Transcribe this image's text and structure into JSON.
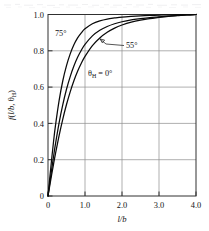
{
  "figure": {
    "background_color": "#ffffff",
    "ink_color": "#0a0a0a",
    "grid_color": "#8e8e8e",
    "scan_artifact_top": true
  },
  "chart_data": {
    "type": "line",
    "title": "",
    "subtitle": "",
    "xlabel": "l/b",
    "ylabel": "f(l/b, θH)",
    "ylabel_parts": {
      "f": "f",
      "open": "(",
      "x": "l/b",
      "comma": ", ",
      "theta": "θ",
      "sub": "H",
      "close": ")"
    },
    "xlim": [
      0,
      4.0
    ],
    "ylim": [
      0,
      1.0
    ],
    "xticks": [
      0,
      1.0,
      2.0,
      3.0,
      4.0
    ],
    "xtick_labels": [
      "0",
      "1.0",
      "2.0",
      "3.0",
      "4.0"
    ],
    "yticks": [
      0,
      0.2,
      0.4,
      0.6,
      0.8,
      1.0
    ],
    "ytick_labels": [
      "0",
      "0.2",
      "0.4",
      "0.6",
      "0.8",
      "1.0"
    ],
    "grid": true,
    "grid_axes": "both",
    "legend": "inline-annotations",
    "legend_position": "inside-plot",
    "annotations": [
      {
        "id": "ann-75",
        "text": "75°",
        "x_px": 55,
        "y_px": 33,
        "leader": false
      },
      {
        "id": "ann-55",
        "text": "55°",
        "x_px": 126,
        "y_px": 45,
        "leader": true
      },
      {
        "id": "ann-theta-0",
        "text": "θH = 0°",
        "x_px": 88,
        "y_px": 73,
        "leader": false
      }
    ],
    "annotation_theta_parts": {
      "theta": "θ",
      "sub": "H",
      "eq": " = 0",
      "deg": "°"
    },
    "series": [
      {
        "name": "75°",
        "label": "75°",
        "x": [
          0,
          0.05,
          0.1,
          0.15,
          0.2,
          0.3,
          0.4,
          0.5,
          0.6,
          0.7,
          0.8,
          0.9,
          1.0,
          1.2,
          1.4,
          1.6,
          1.8,
          2.0,
          2.25,
          2.5,
          2.75,
          3.0,
          3.25,
          3.5,
          3.75,
          4.0
        ],
        "values": [
          0,
          0.105,
          0.205,
          0.3,
          0.385,
          0.525,
          0.635,
          0.718,
          0.783,
          0.833,
          0.871,
          0.899,
          0.921,
          0.949,
          0.965,
          0.975,
          0.981,
          0.986,
          0.99,
          0.993,
          0.995,
          0.9965,
          0.998,
          0.9988,
          0.9995,
          1.0
        ]
      },
      {
        "name": "55°",
        "label": "55°",
        "x": [
          0,
          0.05,
          0.1,
          0.15,
          0.2,
          0.3,
          0.4,
          0.5,
          0.6,
          0.7,
          0.8,
          0.9,
          1.0,
          1.2,
          1.4,
          1.6,
          1.8,
          2.0,
          2.25,
          2.5,
          2.75,
          3.0,
          3.25,
          3.5,
          3.75,
          4.0
        ],
        "values": [
          0,
          0.075,
          0.148,
          0.218,
          0.284,
          0.403,
          0.503,
          0.588,
          0.658,
          0.716,
          0.764,
          0.803,
          0.835,
          0.882,
          0.913,
          0.934,
          0.949,
          0.96,
          0.97,
          0.977,
          0.983,
          0.987,
          0.991,
          0.995,
          0.998,
          1.0
        ]
      },
      {
        "name": "θH = 0°",
        "label": "θH = 0°",
        "x": [
          0,
          0.05,
          0.1,
          0.15,
          0.2,
          0.3,
          0.4,
          0.5,
          0.6,
          0.7,
          0.8,
          0.9,
          1.0,
          1.2,
          1.4,
          1.6,
          1.8,
          2.0,
          2.25,
          2.5,
          2.75,
          3.0,
          3.25,
          3.5,
          3.75,
          4.0
        ],
        "values": [
          0,
          0.06,
          0.119,
          0.176,
          0.231,
          0.333,
          0.424,
          0.504,
          0.574,
          0.635,
          0.687,
          0.731,
          0.769,
          0.829,
          0.871,
          0.902,
          0.925,
          0.942,
          0.958,
          0.969,
          0.977,
          0.984,
          0.99,
          0.994,
          0.998,
          1.0
        ]
      }
    ]
  }
}
